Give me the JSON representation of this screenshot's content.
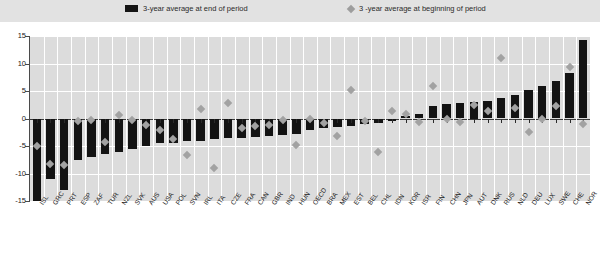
{
  "legend": {
    "series_bar_label": "3-year average at end of period",
    "series_marker_label": "3 -year average at beginning of period",
    "bar_color": "#131313",
    "marker_color": "#a2a2a2"
  },
  "axis": {
    "y_ticks": [
      "15",
      "10",
      "5",
      "0",
      "-5",
      "-10",
      "-15"
    ],
    "y_min": -15,
    "y_max": 15,
    "y_step": 5
  },
  "chart_data": {
    "type": "bar",
    "title": "",
    "subtitle": "",
    "xlabel": "",
    "ylabel": "",
    "ylim": [
      -15,
      15
    ],
    "grid": true,
    "legend_position": "top",
    "categories": [
      "ISL",
      "GRC",
      "PRT",
      "ESP",
      "ZAF",
      "TUR",
      "NZL",
      "SVK",
      "AUS",
      "USA",
      "POL",
      "SVN",
      "IRL",
      "ITA",
      "CZE",
      "FRA",
      "CAN",
      "GBR",
      "IND",
      "HUN",
      "OECD",
      "BRA",
      "MEX",
      "EST",
      "BEL",
      "CHL",
      "IDN",
      "KOR",
      "ISR",
      "FIN",
      "CHN",
      "JPN",
      "AUT",
      "DNK",
      "RUS",
      "NLD",
      "DEU",
      "LUX",
      "SWE",
      "CHE",
      "NOR"
    ],
    "series": [
      {
        "name": "3-year average at end of period",
        "type": "bar",
        "color": "#131313",
        "values": [
          -16.5,
          -11.0,
          -13.0,
          -7.5,
          -7.0,
          -6.5,
          -6.0,
          -5.5,
          -5.0,
          -4.5,
          -4.5,
          -4.0,
          -4.0,
          -3.8,
          -3.6,
          -3.5,
          -3.4,
          -3.2,
          -3.0,
          -2.8,
          -2.0,
          -1.8,
          -1.6,
          -1.3,
          -1.0,
          -0.9,
          -0.5,
          0.4,
          0.9,
          2.3,
          2.6,
          2.8,
          3.0,
          3.2,
          3.7,
          4.3,
          5.1,
          6.0,
          6.8,
          8.2,
          14.2
        ]
      },
      {
        "name": "3 -year average at beginning of period",
        "type": "scatter",
        "color": "#a2a2a2",
        "values": [
          -5.0,
          -8.3,
          -8.4,
          -0.4,
          -0.3,
          -4.3,
          0.6,
          -0.2,
          -1.2,
          -2.0,
          -3.8,
          -6.6,
          1.7,
          -9.0,
          2.8,
          -1.7,
          -1.4,
          -1.2,
          -0.3,
          -4.8,
          0.0,
          -0.8,
          -3.2,
          5.1,
          -0.5,
          -6.0,
          1.4,
          0.9,
          -0.7,
          5.9,
          0.0,
          -0.6,
          2.4,
          1.4,
          11.0,
          2.0,
          -2.5,
          0.0,
          2.2,
          9.3,
          -1.0
        ]
      }
    ]
  }
}
